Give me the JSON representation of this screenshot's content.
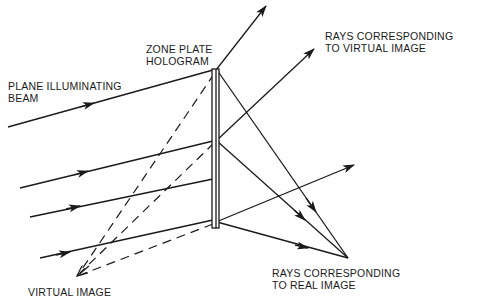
{
  "diagram": {
    "type": "optics-schematic",
    "labels": {
      "plate_line1": "ZONE PLATE",
      "plate_line2": "HOLOGRAM",
      "beam_line1": "PLANE ILLUMINATING",
      "beam_line2": "BEAM",
      "virtual_rays_line1": "RAYS CORRESPONDING",
      "virtual_rays_line2": "TO VIRTUAL IMAGE",
      "real_rays_line1": "RAYS CORRESPONDING",
      "real_rays_line2": "TO REAL IMAGE",
      "virtual_image": "VIRTUAL IMAGE"
    },
    "elements": {
      "hologram_plate": {
        "x": 212,
        "y": 69,
        "width": 7,
        "height": 159
      },
      "incident_rays": [
        {
          "from": [
            8,
            127
          ],
          "to": [
            213,
            70
          ]
        },
        {
          "from": [
            20,
            188
          ],
          "to": [
            213,
            141
          ]
        },
        {
          "from": [
            30,
            217
          ],
          "to": [
            213,
            179
          ]
        },
        {
          "from": [
            40,
            258
          ],
          "to": [
            213,
            220
          ]
        }
      ],
      "virtual_rays": [
        {
          "from": [
            216,
            70
          ],
          "to": [
            266,
            6
          ]
        },
        {
          "from": [
            216,
            141
          ],
          "to": [
            314,
            49
          ]
        },
        {
          "from": [
            216,
            222
          ],
          "to": [
            354,
            165
          ]
        }
      ],
      "real_rays": [
        {
          "from": [
            217,
            70
          ],
          "to": [
            348,
            258
          ]
        },
        {
          "from": [
            217,
            141
          ],
          "to": [
            348,
            258
          ]
        },
        {
          "from": [
            217,
            222
          ],
          "to": [
            348,
            258
          ]
        }
      ],
      "real_image_point": [
        348,
        258
      ],
      "virtual_image_point": [
        77,
        276
      ],
      "dashed_back_projections": [
        {
          "from": [
            214,
            74
          ],
          "to": [
            77,
            276
          ]
        },
        {
          "from": [
            214,
            143
          ],
          "to": [
            77,
            276
          ]
        },
        {
          "from": [
            213,
            224
          ],
          "to": [
            77,
            276
          ]
        }
      ]
    },
    "colors": {
      "ink": "#1a1a1a",
      "background": "#ffffff"
    }
  }
}
